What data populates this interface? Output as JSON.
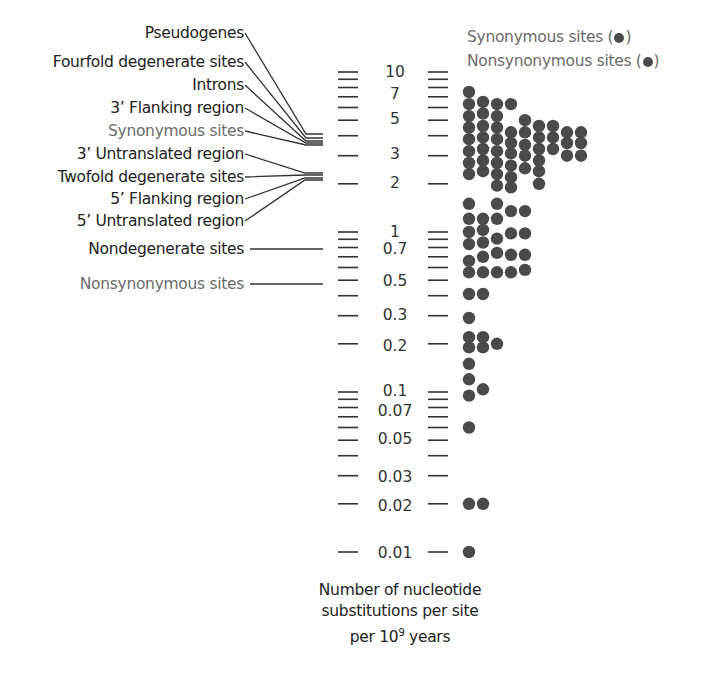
{
  "chart_data": {
    "type": "scatter",
    "subtype": "log-scale dot plot of substitution rates",
    "title": "",
    "ylabel": "Number of nucleotide substitutions per site per 10^9 years",
    "yscale": "log",
    "ylim": [
      0.01,
      10
    ],
    "y_tick_labels": [
      "10",
      "7",
      "5",
      "3",
      "2",
      "1",
      "0.7",
      "0.5",
      "0.3",
      "0.2",
      "0.1",
      "0.07",
      "0.05",
      "0.03",
      "0.02",
      "0.01"
    ],
    "y_minor_ticks": [
      10,
      9,
      8,
      7,
      6,
      5,
      4,
      3,
      2,
      1,
      0.9,
      0.8,
      0.7,
      0.6,
      0.5,
      0.4,
      0.3,
      0.2,
      0.1,
      0.09,
      0.08,
      0.07,
      0.06,
      0.05,
      0.04,
      0.03,
      0.02,
      0.01
    ],
    "legend": [
      {
        "label": "Synonymous sites",
        "marker": "dot",
        "color": "#4a4a4a"
      },
      {
        "label": "Nonsynonymous sites",
        "marker": "dot",
        "color": "#4a4a4a"
      }
    ],
    "region_labels": [
      {
        "label": "Pseudogenes",
        "approx_rate": 4.0,
        "group": "upper"
      },
      {
        "label": "Fourfold degenerate sites",
        "approx_rate": 3.9,
        "group": "upper"
      },
      {
        "label": "Introns",
        "approx_rate": 3.8,
        "group": "upper"
      },
      {
        "label": "3' Flanking region",
        "approx_rate": 3.7,
        "group": "upper"
      },
      {
        "label": "Synonymous sites",
        "approx_rate": 3.6,
        "group": "upper",
        "highlight": true
      },
      {
        "label": "3' Untranslated region",
        "approx_rate": 2.1,
        "group": "lower"
      },
      {
        "label": "Twofold degenerate sites",
        "approx_rate": 2.05,
        "group": "lower"
      },
      {
        "label": "5' Flanking region",
        "approx_rate": 2.0,
        "group": "lower"
      },
      {
        "label": "5' Untranslated region",
        "approx_rate": 1.95,
        "group": "lower"
      },
      {
        "label": "Nondegenerate sites",
        "approx_rate": 0.7,
        "group": "single"
      },
      {
        "label": "Nonsynonymous sites",
        "approx_rate": 0.5,
        "group": "single",
        "highlight": true
      }
    ],
    "dot_columns_note": "Each dot is one gene; dots stacked horizontally at approximately equal rate values",
    "dots": [
      {
        "col": 0,
        "value": 7.5
      },
      {
        "col": 0,
        "value": 6.3
      },
      {
        "col": 0,
        "value": 5.3
      },
      {
        "col": 0,
        "value": 4.5
      },
      {
        "col": 0,
        "value": 3.8
      },
      {
        "col": 0,
        "value": 3.2
      },
      {
        "col": 0,
        "value": 2.7
      },
      {
        "col": 0,
        "value": 2.3
      },
      {
        "col": 1,
        "value": 6.5
      },
      {
        "col": 1,
        "value": 5.5
      },
      {
        "col": 1,
        "value": 4.6
      },
      {
        "col": 1,
        "value": 3.9
      },
      {
        "col": 1,
        "value": 3.3
      },
      {
        "col": 1,
        "value": 2.8
      },
      {
        "col": 1,
        "value": 2.4
      },
      {
        "col": 2,
        "value": 6.3
      },
      {
        "col": 2,
        "value": 5.3
      },
      {
        "col": 2,
        "value": 4.5
      },
      {
        "col": 2,
        "value": 3.8
      },
      {
        "col": 2,
        "value": 3.2
      },
      {
        "col": 2,
        "value": 2.7
      },
      {
        "col": 2,
        "value": 2.3
      },
      {
        "col": 2,
        "value": 1.95
      },
      {
        "col": 3,
        "value": 6.3
      },
      {
        "col": 3,
        "value": 4.2
      },
      {
        "col": 3,
        "value": 3.6
      },
      {
        "col": 3,
        "value": 3.1
      },
      {
        "col": 3,
        "value": 2.6
      },
      {
        "col": 3,
        "value": 2.2
      },
      {
        "col": 3,
        "value": 1.9
      },
      {
        "col": 4,
        "value": 5.0
      },
      {
        "col": 4,
        "value": 4.2
      },
      {
        "col": 4,
        "value": 3.5
      },
      {
        "col": 4,
        "value": 3.0
      },
      {
        "col": 4,
        "value": 2.5
      },
      {
        "col": 5,
        "value": 4.6
      },
      {
        "col": 5,
        "value": 3.9
      },
      {
        "col": 5,
        "value": 3.3
      },
      {
        "col": 5,
        "value": 2.8
      },
      {
        "col": 5,
        "value": 2.4
      },
      {
        "col": 5,
        "value": 2.0
      },
      {
        "col": 6,
        "value": 4.6
      },
      {
        "col": 6,
        "value": 3.9
      },
      {
        "col": 6,
        "value": 3.3
      },
      {
        "col": 7,
        "value": 4.2
      },
      {
        "col": 7,
        "value": 3.6
      },
      {
        "col": 7,
        "value": 3.0
      },
      {
        "col": 8,
        "value": 4.2
      },
      {
        "col": 8,
        "value": 3.6
      },
      {
        "col": 8,
        "value": 3.0
      },
      {
        "col": 0,
        "value": 1.5
      },
      {
        "col": 2,
        "value": 1.5
      },
      {
        "col": 3,
        "value": 1.35
      },
      {
        "col": 4,
        "value": 1.35
      },
      {
        "col": 0,
        "value": 1.21
      },
      {
        "col": 1,
        "value": 1.21
      },
      {
        "col": 2,
        "value": 1.21
      },
      {
        "col": 1,
        "value": 1.03
      },
      {
        "col": 0,
        "value": 1.0
      },
      {
        "col": 3,
        "value": 0.98
      },
      {
        "col": 4,
        "value": 0.98
      },
      {
        "col": 2,
        "value": 0.91
      },
      {
        "col": 1,
        "value": 0.86
      },
      {
        "col": 0,
        "value": 0.84
      },
      {
        "col": 2,
        "value": 0.74
      },
      {
        "col": 1,
        "value": 0.7
      },
      {
        "col": 3,
        "value": 0.72
      },
      {
        "col": 4,
        "value": 0.72
      },
      {
        "col": 0,
        "value": 0.66
      },
      {
        "col": 0,
        "value": 0.56
      },
      {
        "col": 1,
        "value": 0.56
      },
      {
        "col": 2,
        "value": 0.56
      },
      {
        "col": 3,
        "value": 0.56
      },
      {
        "col": 4,
        "value": 0.58
      },
      {
        "col": 0,
        "value": 0.41
      },
      {
        "col": 1,
        "value": 0.41
      },
      {
        "col": 0,
        "value": 0.29
      },
      {
        "col": 0,
        "value": 0.22
      },
      {
        "col": 1,
        "value": 0.22
      },
      {
        "col": 0,
        "value": 0.19
      },
      {
        "col": 1,
        "value": 0.19
      },
      {
        "col": 2,
        "value": 0.2
      },
      {
        "col": 0,
        "value": 0.15
      },
      {
        "col": 0,
        "value": 0.12
      },
      {
        "col": 0,
        "value": 0.095
      },
      {
        "col": 1,
        "value": 0.104
      },
      {
        "col": 0,
        "value": 0.06
      },
      {
        "col": 0,
        "value": 0.02
      },
      {
        "col": 1,
        "value": 0.02
      },
      {
        "col": 0,
        "value": 0.01
      }
    ],
    "grid": false,
    "legend_position": "top-right"
  },
  "labels": {
    "pseudogenes": "Pseudogenes",
    "fourfold": "Fourfold degenerate sites",
    "introns": "Introns",
    "flank3": "3’ Flanking region",
    "synonymous": "Synonymous sites",
    "utr3": "3’ Untranslated region",
    "twofold": "Twofold degenerate sites",
    "flank5": "5’ Flanking region",
    "utr5": "5’ Untranslated region",
    "nondegenerate": "Nondegenerate sites",
    "nonsynonymous": "Nonsynonymous sites"
  },
  "legend": {
    "synonymous_text": "Synonymous sites (",
    "nonsynonymous_text": "Nonsynonymous sites (",
    "close": ")"
  },
  "axis": {
    "title_line1": "Number of nucleotide",
    "title_line2": "substitutions per site",
    "title_line3_prefix": "per 10",
    "title_line3_exp": "9",
    "title_line3_suffix": " years"
  },
  "ticks": {
    "t10": "10",
    "t7": "7",
    "t5": "5",
    "t3": "3",
    "t2": "2",
    "t1": "1",
    "t07": "0.7",
    "t05": "0.5",
    "t03": "0.3",
    "t02": "0.2",
    "t01": "0.1",
    "t007": "0.07",
    "t005": "0.05",
    "t003": "0.03",
    "t002": "0.02",
    "t001": "0.01"
  },
  "colors": {
    "dot": "#4a4a4a",
    "text": "#222222",
    "highlight_text": "#6b6b6b",
    "line": "#333333"
  }
}
